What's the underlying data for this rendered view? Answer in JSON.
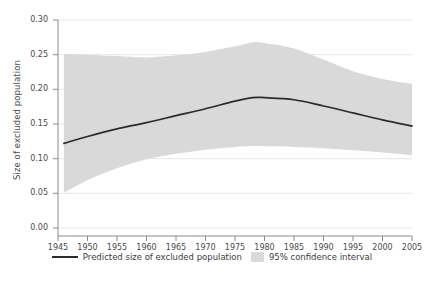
{
  "chart_data": {
    "type": "line",
    "title": "",
    "xlabel": "",
    "ylabel": "Size of excluded population",
    "xlim": [
      1945,
      2005
    ],
    "ylim": [
      0.0,
      0.3
    ],
    "xticks": [
      1945,
      1950,
      1955,
      1960,
      1965,
      1970,
      1975,
      1980,
      1985,
      1990,
      1995,
      2000,
      2005
    ],
    "yticks": [
      "0.00",
      "0.05",
      "0.10",
      "0.15",
      "0.20",
      "0.25",
      "0.30"
    ],
    "ytick_values": [
      0.0,
      0.05,
      0.1,
      0.15,
      0.2,
      0.25,
      0.3
    ],
    "grid": "horizontal",
    "legend_position": "bottom",
    "x": [
      1946,
      1950,
      1955,
      1960,
      1965,
      1970,
      1975,
      1978,
      1980,
      1985,
      1990,
      1995,
      2000,
      2005
    ],
    "series": [
      {
        "name": "Predicted size of excluded population",
        "type": "line",
        "color": "#2b2b2b",
        "values": [
          0.122,
          0.132,
          0.143,
          0.152,
          0.162,
          0.172,
          0.183,
          0.188,
          0.188,
          0.185,
          0.176,
          0.166,
          0.156,
          0.147
        ]
      },
      {
        "name": "95% confidence interval",
        "type": "band",
        "color": "#d9d9d9",
        "upper": [
          0.251,
          0.25,
          0.248,
          0.246,
          0.249,
          0.254,
          0.262,
          0.268,
          0.267,
          0.259,
          0.243,
          0.226,
          0.215,
          0.208
        ],
        "lower": [
          0.051,
          0.069,
          0.086,
          0.099,
          0.107,
          0.113,
          0.117,
          0.118,
          0.118,
          0.117,
          0.115,
          0.112,
          0.109,
          0.105
        ]
      }
    ],
    "legend": [
      {
        "label": "Predicted size of excluded population",
        "marker": "line",
        "color": "#2b2b2b"
      },
      {
        "label": "95% confidence interval",
        "marker": "band",
        "color": "#d9d9d9"
      }
    ]
  },
  "axes": {
    "y_title": "Size of excluded population"
  },
  "caption": ""
}
